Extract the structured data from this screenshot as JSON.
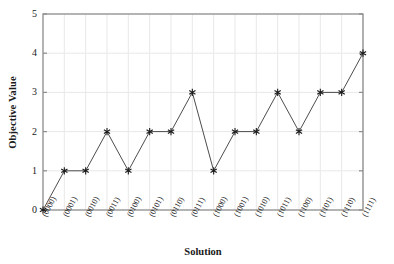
{
  "chart_data": {
    "type": "line",
    "title": "",
    "xlabel": "Solution",
    "ylabel": "Objective Value",
    "categories": [
      "(0000)",
      "(0001)",
      "(0010)",
      "(0011)",
      "(0100)",
      "(0101)",
      "(0110)",
      "(0111)",
      "(1000)",
      "(1001)",
      "(1010)",
      "(1011)",
      "(1100)",
      "(1101)",
      "(1110)",
      "(1111)"
    ],
    "values": [
      0,
      1,
      1,
      2,
      1,
      2,
      2,
      3,
      1,
      2,
      2,
      3,
      2,
      3,
      3,
      4
    ],
    "ylim": [
      0,
      5
    ],
    "ytick_labels": [
      "0",
      "1",
      "2",
      "3",
      "4",
      "5"
    ],
    "grid": true,
    "legend": false,
    "marker": "asterisk",
    "line_color": "#4d4d4d",
    "marker_color": "#1a1a1a",
    "grid_color": "#e8e8e8",
    "axis_color": "#8c8c8c",
    "background": "#ffffff"
  }
}
